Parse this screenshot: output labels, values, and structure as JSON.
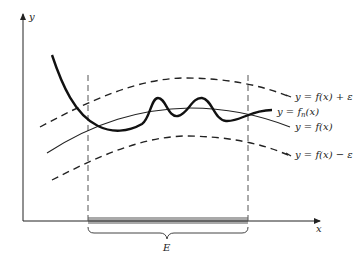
{
  "figure": {
    "axes": {
      "y_label": "y",
      "x_label": "x"
    },
    "curves": [
      {
        "id": "upper-bound",
        "label": "y = f(x) + ε",
        "style": "dashed"
      },
      {
        "id": "fn",
        "label": "y = f",
        "label_sub": "n",
        "label_tail": "(x)",
        "style": "thick-solid"
      },
      {
        "id": "f",
        "label": "y = f(x)",
        "style": "solid"
      },
      {
        "id": "lower-bound",
        "label": "y = f(x) − ε",
        "style": "dashed"
      }
    ],
    "set_label": "E",
    "colors": {
      "ink": "#222222",
      "shade": "#9a9a9a",
      "guide": "#555555"
    }
  }
}
